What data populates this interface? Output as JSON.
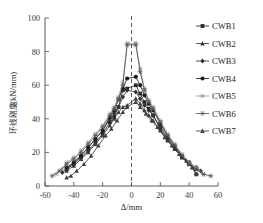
{
  "chart_data": {
    "type": "line",
    "title": "",
    "xlabel": "Δ/mm",
    "ylabel": "环线刚度/(kN/mm)",
    "ylabel_cjk": "环线刚度",
    "ylabel_unit": "/(kN/mm)",
    "xlim": [
      -60,
      60
    ],
    "ylim": [
      0,
      100
    ],
    "xticks": [
      -60,
      -40,
      -20,
      0,
      20,
      40,
      60
    ],
    "yticks": [
      0,
      20,
      40,
      60,
      80,
      100
    ],
    "grid": false,
    "legend_position": "right",
    "reference_line": {
      "axis": "x",
      "value": 0,
      "style": "dashed"
    },
    "series": [
      {
        "name": "CWB1",
        "marker": "square",
        "color": "#2b2b2b",
        "x": [
          -45,
          -40,
          -35,
          -30,
          -25,
          -20,
          -15,
          -12,
          -9,
          -6,
          -3,
          3,
          6,
          9,
          12,
          15,
          20,
          25,
          30,
          35,
          40,
          45
        ],
        "y": [
          10,
          13,
          17,
          21,
          26,
          31,
          38,
          41,
          47,
          57,
          58,
          60,
          55,
          50,
          46,
          42,
          34,
          28,
          22,
          17,
          13,
          10
        ]
      },
      {
        "name": "CWB2",
        "marker": "triangle",
        "color": "#3a3a3a",
        "x": [
          -45,
          -40,
          -35,
          -30,
          -25,
          -20,
          -15,
          -12,
          -9,
          -6,
          -3,
          3,
          6,
          9,
          12,
          15,
          20,
          25,
          30,
          35,
          40,
          45
        ],
        "y": [
          9,
          12,
          16,
          20,
          25,
          30,
          36,
          40,
          44,
          47,
          48,
          52,
          49,
          45,
          42,
          39,
          33,
          27,
          22,
          17,
          13,
          10
        ]
      },
      {
        "name": "CWB3",
        "marker": "diamond",
        "color": "#333333",
        "x": [
          -48,
          -45,
          -40,
          -35,
          -30,
          -25,
          -20,
          -15,
          -12,
          -9,
          -6,
          -3,
          3,
          6,
          9,
          12,
          15,
          20,
          25,
          30,
          35,
          40,
          45,
          48
        ],
        "y": [
          8,
          10,
          14,
          18,
          23,
          28,
          33,
          40,
          43,
          47,
          53,
          57,
          56,
          52,
          48,
          45,
          42,
          35,
          29,
          23,
          18,
          14,
          11,
          9
        ]
      },
      {
        "name": "CWB4",
        "marker": "circle",
        "color": "#1f1f1f",
        "x": [
          -45,
          -40,
          -35,
          -30,
          -25,
          -20,
          -15,
          -12,
          -9,
          -6,
          -3,
          3,
          6,
          9,
          12,
          15,
          20,
          25,
          30,
          35,
          40,
          45
        ],
        "y": [
          11,
          14,
          18,
          23,
          28,
          33,
          41,
          45,
          52,
          58,
          64,
          65,
          60,
          54,
          49,
          45,
          37,
          30,
          24,
          18,
          14,
          7
        ]
      },
      {
        "name": "CWB5",
        "marker": "star-light",
        "color": "#9a9a9a",
        "x": [
          -52,
          -48,
          -45,
          -40,
          -35,
          -30,
          -25,
          -20,
          -15,
          -12,
          -9,
          -6,
          -3,
          3,
          6,
          9,
          12,
          15,
          20,
          25,
          30,
          35,
          40,
          45,
          50
        ],
        "y": [
          7,
          10,
          14,
          17,
          21,
          26,
          31,
          36,
          43,
          47,
          53,
          62,
          85,
          85,
          70,
          58,
          51,
          47,
          39,
          31,
          25,
          19,
          14,
          11,
          7
        ]
      },
      {
        "name": "CWB6",
        "marker": "star",
        "color": "#555555",
        "x": [
          -55,
          -50,
          -45,
          -40,
          -35,
          -30,
          -25,
          -20,
          -15,
          -12,
          -9,
          -6,
          -3,
          3,
          6,
          9,
          12,
          15,
          20,
          25,
          30,
          35,
          40,
          45,
          50,
          55
        ],
        "y": [
          6,
          9,
          13,
          16,
          20,
          25,
          30,
          35,
          42,
          46,
          51,
          60,
          84,
          84,
          68,
          57,
          50,
          46,
          38,
          30,
          24,
          18,
          13,
          10,
          7,
          6
        ]
      },
      {
        "name": "CWB7",
        "marker": "triangle",
        "color": "#3d3d3d",
        "x": [
          -45,
          -42,
          -38,
          -33,
          -28,
          -23,
          -18,
          -14,
          -10,
          -6,
          -3,
          3,
          6,
          10,
          14,
          18,
          23,
          28,
          33,
          38,
          42,
          45
        ],
        "y": [
          5,
          6,
          9,
          13,
          18,
          24,
          30,
          34,
          39,
          44,
          47,
          50,
          47,
          43,
          39,
          35,
          29,
          24,
          19,
          15,
          11,
          7
        ]
      }
    ]
  },
  "legend": {
    "entries": [
      {
        "label": "CWB1",
        "marker": "square"
      },
      {
        "label": "CWB2",
        "marker": "triangle"
      },
      {
        "label": "CWB3",
        "marker": "diamond"
      },
      {
        "label": "CWB4",
        "marker": "circle"
      },
      {
        "label": "CWB5",
        "marker": "star-light"
      },
      {
        "label": "CWB6",
        "marker": "star"
      },
      {
        "label": "CWB7",
        "marker": "triangle"
      }
    ]
  }
}
